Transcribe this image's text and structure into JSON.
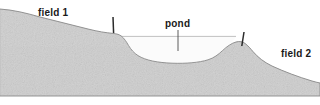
{
  "figure": {
    "width": 320,
    "height": 105,
    "background_color": "#ffffff"
  },
  "colors": {
    "ground_fill": "#c9c9c9",
    "ground_fill_light": "#d6d6d6",
    "ground_outline": "#8a8a8a",
    "water_fill": "#fbfbfb",
    "water_line": "#b0b0b0",
    "stake": "#2b2b2b",
    "leader_line": "#4a4a4a",
    "text": "#1a1a1a"
  },
  "labels": {
    "field_left": "field 1",
    "pond": "pond",
    "field_right": "field 2"
  },
  "label_positions": {
    "field_left": {
      "x": 38,
      "y": 16
    },
    "pond": {
      "x": 165,
      "y": 27
    },
    "field_right": {
      "x": 281,
      "y": 57
    }
  },
  "annotations": {
    "pond_leader_line": {
      "x": 178,
      "y1": 30,
      "y2": 51
    },
    "stake_left": {
      "x1": 113,
      "y1": 17,
      "x2": 113.6,
      "y2": 33
    },
    "stake_right": {
      "x1": 244,
      "y1": 32,
      "x2": 241.8,
      "y2": 46
    }
  },
  "geometry": {
    "ground_profile": "M 0,9 C 14,10 26,13 40,17 C 56,21 72,25 88,29 C 98,31.5 106,32.8 113,33.4 C 117,33.8 119.5,34.6 121.5,36.2 C 124.5,38.6 126.5,42 128.5,45.4 C 131,49.6 134,53 138,55.6 C 146,60.6 158,62.6 172,63.2 C 186,63.7 199,62.6 208,59.8 C 214,58 218.5,54.4 222.5,50.6 C 227,46.4 231.5,43.2 236,42 C 239.5,41.1 242.5,41.6 245,43.4 C 248,45.6 250.5,48.6 253,51.6 C 258,57.4 264,62.2 272,66 C 284,71.6 298,76.8 312,81 C 315,81.9 317.5,82.5 320,83 L 320,96 L 0,96 Z",
    "water_surface": {
      "x1": 121,
      "y1": 36.4,
      "x2": 236,
      "y2": 36.4
    },
    "water_body": "M 121.5,36.4 L 236,36.4 C 231.5,43.2 227,46.4 222.5,50.6 C 218.5,54.4 214,58 208,59.8 C 199,62.6 186,63.7 172,63.2 C 158,62.6 146,60.6 138,55.6 C 134,53 131,49.6 128.5,45.4 C 126.5,42 124.5,38.6 121.5,36.4 Z",
    "baseline_y": 96
  }
}
